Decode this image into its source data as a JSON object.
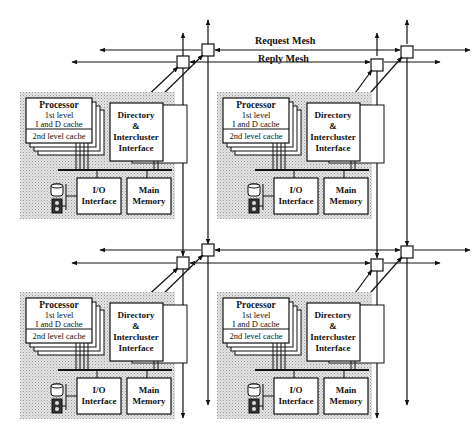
{
  "diagram": {
    "meshes": {
      "request_label": "Request Mesh",
      "reply_label": "Reply Mesh"
    },
    "cluster": {
      "processor_title": "Processor",
      "l1_line1": "1st level",
      "l1_line2": "I and D cache",
      "l2_label": "2nd level cache",
      "directory_line1": "Directory",
      "directory_line2": "&",
      "directory_line3": "Intercluster",
      "directory_line4": "Interface",
      "io_line1": "I/O",
      "io_line2": "Interface",
      "memory_line1": "Main",
      "memory_line2": "Memory",
      "icons": [
        "disk-icon",
        "terminal-icon"
      ]
    },
    "clusters": [
      {
        "id": "top-left",
        "x": 20,
        "y": 92
      },
      {
        "id": "top-right",
        "x": 217,
        "y": 92
      },
      {
        "id": "bottom-left",
        "x": 20,
        "y": 292
      },
      {
        "id": "bottom-right",
        "x": 217,
        "y": 292
      }
    ],
    "colors": {
      "line": "#111111",
      "shade": "#d4d4d4",
      "box": "#ffffff"
    }
  }
}
